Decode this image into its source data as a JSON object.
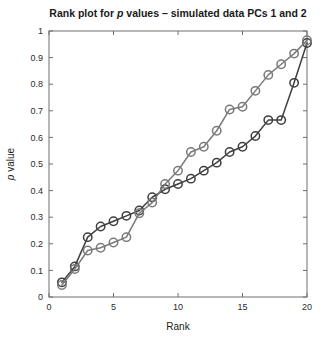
{
  "figure": {
    "width": 325,
    "height": 342,
    "background": "#ffffff"
  },
  "chart_data": {
    "type": "line",
    "title": "Rank plot for p values – simulated data PCs 1 and 2",
    "title_parts": {
      "before": "Rank plot for ",
      "italic": "p",
      "after": " values – simulated data PCs 1 and 2"
    },
    "xlabel": "Rank",
    "ylabel": "p value",
    "ylabel_parts": {
      "italic": "p",
      "after": " value"
    },
    "xlim": [
      0,
      20
    ],
    "ylim": [
      0,
      1
    ],
    "xticks": [
      0,
      5,
      10,
      15,
      20
    ],
    "xticklabels": [
      "0",
      "5",
      "10",
      "15",
      "20"
    ],
    "yticks": [
      0,
      0.1,
      0.2,
      0.3,
      0.4,
      0.5,
      0.6,
      0.7,
      0.8,
      0.9,
      1
    ],
    "yticklabels": [
      "0",
      "0.1",
      "0.2",
      "0.3",
      "0.4",
      "0.5",
      "0.6",
      "0.7",
      "0.8",
      "0.9",
      "1"
    ],
    "grid": false,
    "legend": null,
    "marker": "open-circle",
    "marker_size": 4.2,
    "x": [
      1,
      2,
      3,
      4,
      5,
      6,
      7,
      8,
      9,
      10,
      11,
      12,
      13,
      14,
      15,
      16,
      17,
      18,
      19,
      20
    ],
    "series": [
      {
        "name": "PC 1",
        "color": "#3f3f3f",
        "values": [
          0.055,
          0.115,
          0.225,
          0.265,
          0.285,
          0.305,
          0.325,
          0.375,
          0.405,
          0.425,
          0.445,
          0.475,
          0.505,
          0.545,
          0.565,
          0.605,
          0.665,
          0.665,
          0.805,
          0.955
        ]
      },
      {
        "name": "PC 2",
        "color": "#7a7a7a",
        "values": [
          0.045,
          0.105,
          0.175,
          0.185,
          0.205,
          0.225,
          0.315,
          0.355,
          0.425,
          0.475,
          0.545,
          0.565,
          0.625,
          0.705,
          0.715,
          0.775,
          0.835,
          0.875,
          0.915,
          0.965
        ]
      }
    ],
    "axis_color": "#6e6e6e",
    "plot_box": {
      "left": 49,
      "top": 31,
      "right": 307,
      "bottom": 297
    }
  }
}
